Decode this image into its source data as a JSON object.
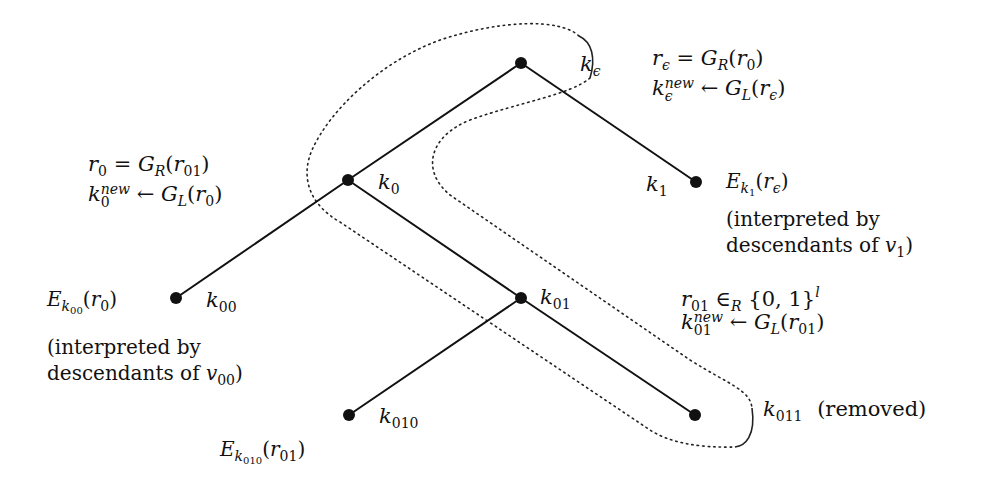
{
  "diagram": {
    "type": "binary-key-tree",
    "nodes": [
      {
        "id": "root",
        "label": "k_ε",
        "x": 521,
        "y": 63
      },
      {
        "id": "k0",
        "label": "k_0",
        "x": 348,
        "y": 180
      },
      {
        "id": "k1",
        "label": "k_1",
        "x": 696,
        "y": 182
      },
      {
        "id": "k00",
        "label": "k_00",
        "x": 176,
        "y": 298
      },
      {
        "id": "k01",
        "label": "k_01",
        "x": 521,
        "y": 298
      },
      {
        "id": "k010",
        "label": "k_010",
        "x": 349,
        "y": 415
      },
      {
        "id": "k011",
        "label": "k_011",
        "x": 695,
        "y": 415
      }
    ],
    "edges": [
      [
        "root",
        "k0"
      ],
      [
        "root",
        "k1"
      ],
      [
        "k0",
        "k00"
      ],
      [
        "k0",
        "k01"
      ],
      [
        "k01",
        "k010"
      ],
      [
        "k01",
        "k011"
      ]
    ],
    "highlighted_path": [
      "root",
      "k0",
      "k01",
      "k011"
    ],
    "labels": {
      "root": {
        "k": "k",
        "sub": "ϵ"
      },
      "k0": {
        "k": "k",
        "sub": "0"
      },
      "k1": {
        "k": "k",
        "sub": "1"
      },
      "k00": {
        "k": "k",
        "sub": "00"
      },
      "k01": {
        "k": "k",
        "sub": "01"
      },
      "k010": {
        "k": "k",
        "sub": "010"
      },
      "k011": {
        "k": "k",
        "sub": "011",
        "note": "(removed)"
      }
    },
    "annotations": {
      "root_eq1": {
        "lhs": "r",
        "lhs_sub": "ϵ",
        "op": " = ",
        "fn": "G",
        "fn_sub": "R",
        "arg": "r",
        "arg_sub": "0"
      },
      "root_eq2": {
        "lhs": "k",
        "lhs_sup": "new",
        "lhs_sub": "ϵ",
        "op": " ← ",
        "fn": "G",
        "fn_sub": "L",
        "arg": "r",
        "arg_sub": "ϵ"
      },
      "k0_eq1": {
        "lhs": "r",
        "lhs_sub": "0",
        "op": " = ",
        "fn": "G",
        "fn_sub": "R",
        "arg": "r",
        "arg_sub": "01"
      },
      "k0_eq2": {
        "lhs": "k",
        "lhs_sup": "new",
        "lhs_sub": "0",
        "op": " ← ",
        "fn": "G",
        "fn_sub": "L",
        "arg": "r",
        "arg_sub": "0"
      },
      "k01_eq1": {
        "lhs": "r",
        "lhs_sub": "01",
        "op": " ∈",
        "op_sub": "R",
        "set": " {0, 1}",
        "set_sup": "l"
      },
      "k01_eq2": {
        "lhs": "k",
        "lhs_sup": "new",
        "lhs_sub": "01",
        "op": " ← ",
        "fn": "G",
        "fn_sub": "L",
        "arg": "r",
        "arg_sub": "01"
      },
      "k1_enc": {
        "E": "E",
        "E_sub": "k",
        "E_subsub": "1",
        "arg": "r",
        "arg_sub": "ϵ",
        "line2": "(interpreted by",
        "line3": "descendants of ",
        "v": "v",
        "v_sub": "1",
        "close": ")"
      },
      "k00_enc": {
        "E": "E",
        "E_sub": "k",
        "E_subsub": "00",
        "arg": "r",
        "arg_sub": "0",
        "line2": "(interpreted by",
        "line3": "descendants of ",
        "v": "v",
        "v_sub": "00",
        "close": ")"
      },
      "k010_enc": {
        "E": "E",
        "E_sub": "k",
        "E_subsub": "010",
        "arg": "r",
        "arg_sub": "01"
      }
    },
    "colors": {
      "ink": "#111111",
      "background": "#ffffff"
    }
  }
}
